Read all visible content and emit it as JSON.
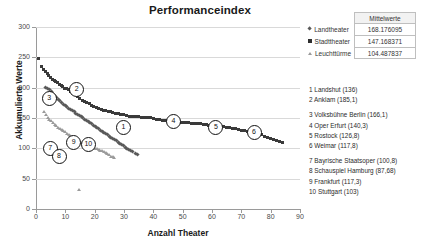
{
  "chart": {
    "title": "Performanceindex",
    "xlabel": "Anzahl Theater",
    "ylabel": "Akkumulierte Werte"
  },
  "axes": {
    "y_ticks": [
      "0",
      "50",
      "100",
      "150",
      "200",
      "250",
      "300"
    ],
    "x_ticks": [
      "0",
      "10",
      "20",
      "30",
      "40",
      "50",
      "60",
      "70",
      "80",
      "90"
    ]
  },
  "legend": {
    "header": "Mittelwerte",
    "rows": [
      {
        "marker": "diamond",
        "label": "Landtheater",
        "value": "168.176095"
      },
      {
        "marker": "square",
        "label": "Stadttheater",
        "value": "147.168371"
      },
      {
        "marker": "triangle",
        "label": "Leuchttürme",
        "value": "104.487837"
      }
    ]
  },
  "annotations": {
    "group1": [
      "1 Landshut (136)",
      "2 Anklam (185,1)"
    ],
    "group2": [
      "3 Volksbühne Berlin (166,1)",
      "4 Oper Erfurt (140,3)",
      "5 Rostock (126,8)",
      "6 Weimar (117,8)"
    ],
    "group3": [
      "7 Bayrische Staatsoper (100,8)",
      "8 Schauspiel Hamburg (87,68)",
      "9 Frankfurt (117,3)",
      "10 Stuttgart (103)"
    ]
  },
  "chart_data": {
    "type": "scatter",
    "title": "Performanceindex",
    "xlabel": "Anzahl Theater",
    "ylabel": "Akkumulierte Werte",
    "xlim": [
      0,
      90
    ],
    "ylim": [
      0,
      300
    ],
    "grid": true,
    "legend_position": "right",
    "series": [
      {
        "name": "Stadttheater",
        "marker": "square",
        "color": "#3a3a3a",
        "mean": 147.168371,
        "points": [
          [
            1,
            248
          ],
          [
            2,
            234
          ],
          [
            2.6,
            230
          ],
          [
            3.2,
            226
          ],
          [
            3.8,
            223
          ],
          [
            4.4,
            220
          ],
          [
            5,
            217
          ],
          [
            5.6,
            214
          ],
          [
            6.2,
            212
          ],
          [
            6.8,
            210
          ],
          [
            7.4,
            208
          ],
          [
            8,
            205
          ],
          [
            8.6,
            203
          ],
          [
            9.2,
            201
          ],
          [
            9.8,
            199
          ],
          [
            10.4,
            198
          ],
          [
            11,
            196
          ],
          [
            11.8,
            194
          ],
          [
            12.6,
            191
          ],
          [
            13.4,
            188
          ],
          [
            14.2,
            185
          ],
          [
            15,
            182
          ],
          [
            15.8,
            179
          ],
          [
            16.6,
            177
          ],
          [
            17.4,
            175
          ],
          [
            18.2,
            173
          ],
          [
            19,
            171
          ],
          [
            19.8,
            169
          ],
          [
            20.6,
            167
          ],
          [
            21.4,
            165
          ],
          [
            22.2,
            164
          ],
          [
            23,
            163
          ],
          [
            23.8,
            162
          ],
          [
            24.6,
            161
          ],
          [
            25.4,
            160
          ],
          [
            26.2,
            159
          ],
          [
            27,
            158
          ],
          [
            28,
            157
          ],
          [
            29,
            156
          ],
          [
            30,
            155
          ],
          [
            31,
            154
          ],
          [
            32,
            153
          ],
          [
            33,
            153
          ],
          [
            34,
            152
          ],
          [
            35,
            152
          ],
          [
            36,
            151
          ],
          [
            37,
            151
          ],
          [
            38,
            150
          ],
          [
            39,
            150
          ],
          [
            40,
            149
          ],
          [
            41,
            148
          ],
          [
            42,
            147
          ],
          [
            43,
            146
          ],
          [
            44,
            146
          ],
          [
            45,
            145
          ],
          [
            46,
            145
          ],
          [
            47,
            144
          ],
          [
            48,
            144
          ],
          [
            49,
            143
          ],
          [
            50,
            143
          ],
          [
            51,
            142
          ],
          [
            52,
            142
          ],
          [
            53,
            141
          ],
          [
            54,
            141
          ],
          [
            55,
            140
          ],
          [
            56,
            140
          ],
          [
            57,
            139
          ],
          [
            58,
            139
          ],
          [
            59,
            138
          ],
          [
            60,
            138
          ],
          [
            61,
            137
          ],
          [
            62,
            137
          ],
          [
            63,
            136
          ],
          [
            64,
            136
          ],
          [
            65,
            135
          ],
          [
            66,
            134
          ],
          [
            67,
            133
          ],
          [
            68,
            132
          ],
          [
            69,
            131
          ],
          [
            70,
            130
          ],
          [
            71,
            129
          ],
          [
            72,
            128
          ],
          [
            73,
            127
          ],
          [
            74,
            126
          ],
          [
            75,
            125
          ],
          [
            76,
            124
          ],
          [
            77,
            122
          ],
          [
            78,
            120
          ],
          [
            79,
            118
          ],
          [
            80,
            116
          ],
          [
            81,
            114
          ],
          [
            82,
            112
          ],
          [
            83,
            111
          ],
          [
            84,
            110
          ]
        ]
      },
      {
        "name": "Landtheater",
        "marker": "diamond",
        "color": "#5a5a5a",
        "mean": 168.176095,
        "points": [
          [
            3.4,
            200
          ],
          [
            4,
            198
          ],
          [
            4.6,
            196
          ],
          [
            5.2,
            193
          ],
          [
            5.8,
            190
          ],
          [
            6.4,
            187
          ],
          [
            7,
            184
          ],
          [
            7.6,
            181
          ],
          [
            8.2,
            178
          ],
          [
            8.8,
            175
          ],
          [
            9.4,
            172
          ],
          [
            10,
            170
          ],
          [
            10.6,
            168
          ],
          [
            11.2,
            166
          ],
          [
            11.8,
            164
          ],
          [
            12.4,
            162
          ],
          [
            13,
            160
          ],
          [
            13.6,
            158
          ],
          [
            14.2,
            156
          ],
          [
            14.8,
            154
          ],
          [
            15.4,
            152
          ],
          [
            16,
            150
          ],
          [
            16.6,
            148
          ],
          [
            17.2,
            146
          ],
          [
            17.8,
            144
          ],
          [
            18.4,
            142
          ],
          [
            19,
            140
          ],
          [
            19.6,
            138
          ],
          [
            20.2,
            136
          ],
          [
            20.8,
            134
          ],
          [
            21.4,
            132
          ],
          [
            22,
            130
          ],
          [
            22.6,
            128
          ],
          [
            23.2,
            126
          ],
          [
            23.8,
            124
          ],
          [
            24.4,
            122
          ],
          [
            25,
            120
          ],
          [
            25.6,
            118
          ],
          [
            26.2,
            116
          ],
          [
            26.8,
            114
          ],
          [
            27.4,
            112
          ],
          [
            28,
            110
          ],
          [
            28.6,
            108
          ],
          [
            29.2,
            106
          ],
          [
            29.8,
            104
          ],
          [
            30.4,
            102
          ],
          [
            31,
            100
          ],
          [
            31.6,
            98
          ],
          [
            32.2,
            96
          ],
          [
            33,
            94
          ],
          [
            33.8,
            92
          ],
          [
            34.6,
            90
          ]
        ]
      },
      {
        "name": "Leuchttürme",
        "marker": "triangle",
        "color": "#9a9a9a",
        "mean": 104.487837,
        "points": [
          [
            2.6,
            160
          ],
          [
            3.2,
            155
          ],
          [
            3.8,
            151
          ],
          [
            4.4,
            148
          ],
          [
            5,
            145
          ],
          [
            5.6,
            142
          ],
          [
            6.2,
            139
          ],
          [
            6.8,
            137
          ],
          [
            7.4,
            135
          ],
          [
            8,
            133
          ],
          [
            8.6,
            131
          ],
          [
            9.2,
            129
          ],
          [
            9.8,
            127
          ],
          [
            10.4,
            125
          ],
          [
            11,
            123
          ],
          [
            11.6,
            121
          ],
          [
            12.2,
            119
          ],
          [
            12.8,
            117
          ],
          [
            13.4,
            115
          ],
          [
            14,
            113
          ],
          [
            14.6,
            111
          ],
          [
            15.2,
            109
          ],
          [
            15.8,
            107
          ],
          [
            16.4,
            105
          ],
          [
            17,
            104
          ],
          [
            17.6,
            103
          ],
          [
            18.2,
            102
          ],
          [
            18.8,
            101
          ],
          [
            19.4,
            100
          ],
          [
            20,
            100
          ],
          [
            20.6,
            99
          ],
          [
            21.2,
            98
          ],
          [
            21.8,
            97
          ],
          [
            22.4,
            96
          ],
          [
            23,
            95
          ],
          [
            23.6,
            93
          ],
          [
            24.2,
            91
          ],
          [
            24.8,
            89
          ],
          [
            25.4,
            87
          ],
          [
            26,
            86
          ],
          [
            26.6,
            85
          ],
          [
            14.6,
            32
          ]
        ]
      }
    ],
    "callouts": [
      {
        "n": "1",
        "x": 29.5,
        "y": 136,
        "label": "Landshut (136)"
      },
      {
        "n": "2",
        "x": 13.5,
        "y": 198,
        "label": "Anklam (185,1)"
      },
      {
        "n": "3",
        "x": 4.2,
        "y": 183,
        "label": "Volksbühne Berlin (166,1)"
      },
      {
        "n": "4",
        "x": 46.5,
        "y": 146,
        "label": "Oper Erfurt (140,3)"
      },
      {
        "n": "5",
        "x": 61,
        "y": 136,
        "label": "Rostock (126,8)"
      },
      {
        "n": "6",
        "x": 74,
        "y": 128,
        "label": "Weimar (117,8)"
      },
      {
        "n": "7",
        "x": 4.5,
        "y": 101,
        "label": "Bayrische Staatsoper (100,8)"
      },
      {
        "n": "8",
        "x": 7.5,
        "y": 89,
        "label": "Schauspiel Hamburg (87,68)"
      },
      {
        "n": "9",
        "x": 12.5,
        "y": 112,
        "label": "Frankfurt (117,3)"
      },
      {
        "n": "10",
        "x": 17.5,
        "y": 108,
        "label": "Stuttgart (103)"
      }
    ]
  }
}
